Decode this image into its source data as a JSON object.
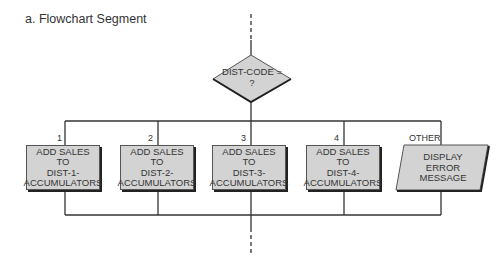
{
  "title": "a. Flowchart Segment",
  "decision": {
    "line1": "DIST-CODE =",
    "line2": "?"
  },
  "branches": [
    {
      "label": "1",
      "lines": [
        "ADD SALES",
        "TO",
        "DIST-1-",
        "ACCUMULATORS"
      ]
    },
    {
      "label": "2",
      "lines": [
        "ADD SALES",
        "TO",
        "DIST-2-",
        "ACCUMULATORS"
      ]
    },
    {
      "label": "3",
      "lines": [
        "ADD SALES",
        "TO",
        "DIST-3-",
        "ACCUMULATORS"
      ]
    },
    {
      "label": "4",
      "lines": [
        "ADD SALES",
        "TO",
        "DIST-4-",
        "ACCUMULATORS"
      ]
    },
    {
      "label": "OTHER",
      "lines": [
        "DISPLAY",
        "ERROR",
        "MESSAGE"
      ]
    }
  ],
  "colors": {
    "fill": "#d3d3d3",
    "line": "#333333",
    "shadow": "#222222"
  }
}
